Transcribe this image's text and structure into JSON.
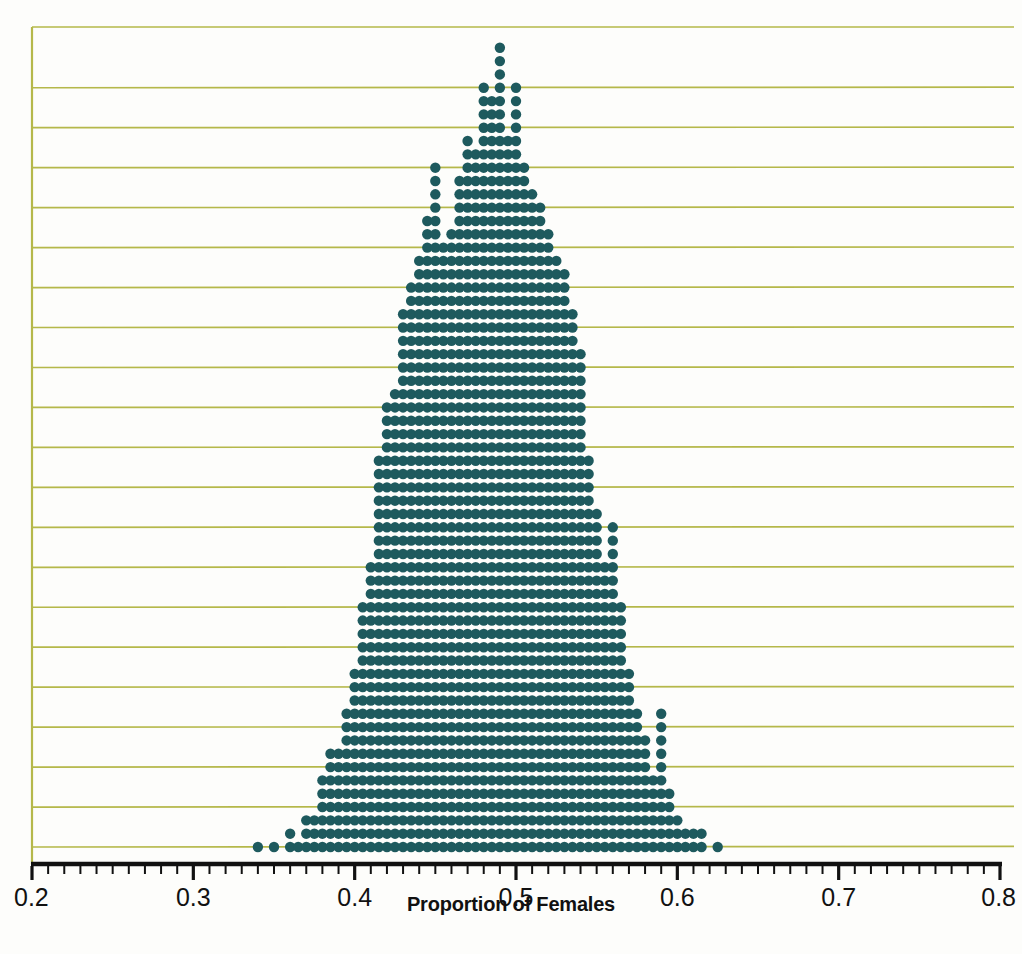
{
  "chart_data": {
    "type": "scatter",
    "plot_style": "dotplot",
    "title": "",
    "xlabel": "Proportion of Females",
    "ylabel": "",
    "xlim": [
      0.2,
      0.8
    ],
    "tick_labels": [
      "0.2",
      "0.3",
      "0.4",
      "0.5",
      "0.6",
      "0.7",
      "0.8"
    ],
    "tick_values": [
      0.2,
      0.3,
      0.4,
      0.5,
      0.6,
      0.7,
      0.8
    ],
    "minor_tick_step": 0.01,
    "grid": "horizontal",
    "gridline_count": 20,
    "gridline_step_dots": 3,
    "legend": "none",
    "dot_stack_axis": "y",
    "x": [
      0.34,
      0.35,
      0.36,
      0.365,
      0.37,
      0.375,
      0.38,
      0.385,
      0.39,
      0.395,
      0.4,
      0.405,
      0.41,
      0.415,
      0.42,
      0.425,
      0.43,
      0.435,
      0.44,
      0.445,
      0.45,
      0.455,
      0.46,
      0.465,
      0.47,
      0.475,
      0.48,
      0.485,
      0.49,
      0.495,
      0.5,
      0.505,
      0.51,
      0.515,
      0.52,
      0.525,
      0.53,
      0.535,
      0.54,
      0.545,
      0.55,
      0.555,
      0.56,
      0.565,
      0.57,
      0.575,
      0.58,
      0.585,
      0.59,
      0.595,
      0.6,
      0.605,
      0.61,
      0.615,
      0.625
    ],
    "counts": [
      1,
      1,
      2,
      1,
      3,
      3,
      6,
      8,
      8,
      11,
      14,
      19,
      22,
      30,
      34,
      35,
      41,
      43,
      45,
      48,
      52,
      46,
      47,
      51,
      54,
      53,
      58,
      57,
      61,
      54,
      58,
      52,
      50,
      49,
      47,
      45,
      44,
      41,
      38,
      30,
      26,
      22,
      25,
      19,
      14,
      11,
      9,
      6,
      11,
      5,
      3,
      2,
      2,
      2,
      1
    ],
    "total_dots": 1600,
    "mode_x": 0.49,
    "mode_count": 61,
    "min_x": 0.34,
    "max_x": 0.625
  },
  "axis": {
    "x_label": "Proportion of Females",
    "labels": [
      {
        "text": "0.2",
        "value": 0.2
      },
      {
        "text": "0.3",
        "value": 0.3
      },
      {
        "text": "0.4",
        "value": 0.4
      },
      {
        "text": "0.5",
        "value": 0.5
      },
      {
        "text": "0.6",
        "value": 0.6
      },
      {
        "text": "0.7",
        "value": 0.7
      },
      {
        "text": "0.8",
        "value": 0.8
      }
    ]
  },
  "colors": {
    "dot": "#1e5a5e",
    "gridline": "#b5b84a",
    "axis": "#111111",
    "background": "#fdfdfb",
    "plot_border_left": "#b5b84a"
  }
}
